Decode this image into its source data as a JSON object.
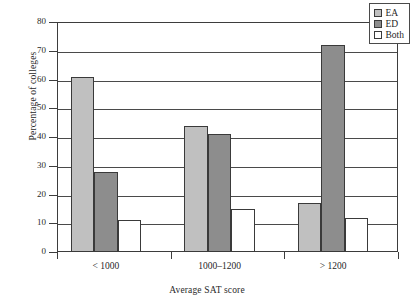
{
  "chart_data": {
    "type": "bar",
    "title": "",
    "xlabel": "Average SAT score",
    "ylabel": "Percentage of colleges",
    "categories": [
      "< 1000",
      "1000–1200",
      "> 1200"
    ],
    "series": [
      {
        "name": "EA",
        "values": [
          61,
          44,
          17
        ],
        "color": "#c0c0c0"
      },
      {
        "name": "ED",
        "values": [
          28,
          41,
          72
        ],
        "color": "#8d8d8d"
      },
      {
        "name": "Both",
        "values": [
          11,
          15,
          12
        ],
        "color": "#ffffff"
      }
    ],
    "ylim": [
      0,
      80
    ],
    "yticks": [
      0,
      10,
      20,
      30,
      40,
      50,
      60,
      70,
      80
    ],
    "ytick_labels": [
      "0",
      "10",
      "20",
      "30",
      "40",
      "50",
      "60",
      "70",
      "80"
    ],
    "grid": true,
    "grid_axis": "y",
    "legend_position": "top-right",
    "legend_entries": [
      "EA",
      "ED",
      "Both"
    ]
  }
}
